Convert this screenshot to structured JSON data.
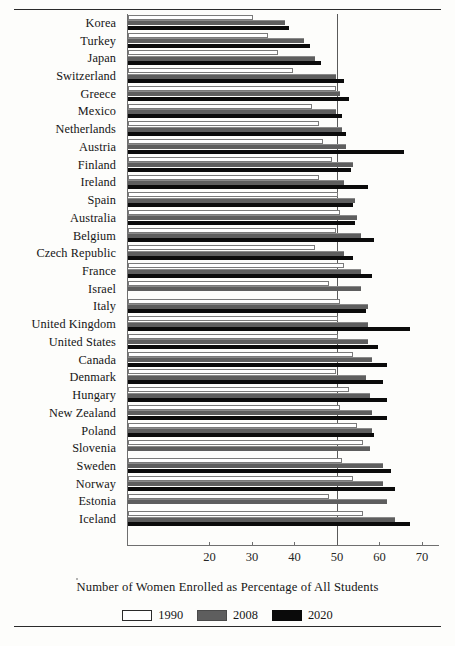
{
  "chart_data": {
    "type": "bar",
    "orientation": "horizontal",
    "title": "",
    "xlabel": "Number of Women Enrolled as Percentage of All Students",
    "ylabel": "",
    "xlim": [
      0.6,
      74
    ],
    "xticks": [
      20,
      30,
      40,
      50,
      60,
      70
    ],
    "reference_line": 50,
    "grid": false,
    "legend_position": "bottom",
    "categories": [
      "Korea",
      "Turkey",
      "Japan",
      "Switzerland",
      "Greece",
      "Mexico",
      "Netherlands",
      "Austria",
      "Finland",
      "Ireland",
      "Spain",
      "Australia",
      "Belgium",
      "Czech Republic",
      "France",
      "Israel",
      "Italy",
      "United Kingdom",
      "United States",
      "Canada",
      "Denmark",
      "Hungary",
      "New Zealand",
      "Poland",
      "Slovenia",
      "Sweden",
      "Norway",
      "Estonia",
      "Iceland"
    ],
    "series": [
      {
        "name": "1990",
        "color": "#ffffff",
        "values": [
          30.0,
          33.5,
          36.0,
          39.5,
          49.5,
          44.0,
          45.5,
          46.5,
          48.5,
          45.5,
          50.0,
          50.5,
          49.5,
          44.5,
          51.5,
          48.0,
          50.5,
          50.0,
          50.0,
          53.5,
          49.5,
          52.5,
          50.5,
          54.5,
          56.0,
          51.0,
          53.5,
          48.0,
          56.0
        ]
      },
      {
        "name": "2008",
        "color": "#5e5e5e",
        "values": [
          37.5,
          42.0,
          44.5,
          49.5,
          50.5,
          49.5,
          51.0,
          52.0,
          53.5,
          51.5,
          54.0,
          54.5,
          55.5,
          51.5,
          55.5,
          55.5,
          57.0,
          57.0,
          57.0,
          58.0,
          56.5,
          57.5,
          58.0,
          58.0,
          57.5,
          60.5,
          60.5,
          61.5,
          63.5
        ]
      },
      {
        "name": "2020",
        "color": "#0b0b0b",
        "values": [
          38.5,
          43.5,
          46.0,
          51.5,
          52.5,
          51.0,
          52.0,
          65.5,
          53.0,
          57.0,
          53.5,
          54.0,
          58.5,
          53.5,
          58.0,
          null,
          56.5,
          67.0,
          59.5,
          61.5,
          60.5,
          61.5,
          61.5,
          58.5,
          null,
          62.5,
          63.5,
          null,
          67.0
        ]
      }
    ]
  },
  "legend": {
    "items": [
      {
        "label": "1990",
        "swatch_class": "s1990"
      },
      {
        "label": "2008",
        "swatch_class": "s2008"
      },
      {
        "label": "2020",
        "swatch_class": "s2020"
      }
    ]
  }
}
